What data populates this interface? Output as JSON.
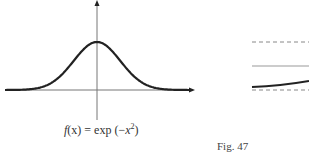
{
  "figure": {
    "label": "Fig. 47",
    "left_panel": {
      "caption_prefix": "f",
      "caption_arg": "(x)",
      "caption_eq": " = exp (−",
      "caption_var": "x",
      "caption_exp": "2",
      "caption_close": ")",
      "caption_full": "f(x) = exp(−x²)"
    },
    "right_panel": {
      "lines": [
        "dashed upper bound",
        "solid middle line",
        "thick curve",
        "dashed lower bound"
      ]
    }
  },
  "chart_data": {
    "type": "line",
    "xlabel": "",
    "ylabel": "",
    "series": [
      {
        "name": "exp(-x^2)",
        "x": [
          -2.5,
          -2,
          -1.5,
          -1,
          -0.5,
          0,
          0.5,
          1,
          1.5,
          2,
          2.5
        ],
        "values": [
          0.002,
          0.018,
          0.105,
          0.368,
          0.779,
          1.0,
          0.779,
          0.368,
          0.105,
          0.018,
          0.002
        ]
      }
    ],
    "axes": "centered, arrows on positive x and y",
    "grid": false,
    "ticks": "none"
  }
}
